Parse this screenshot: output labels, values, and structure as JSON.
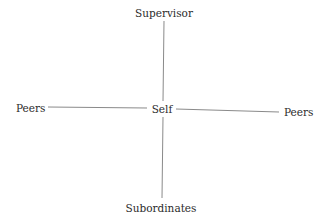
{
  "diagram": {
    "type": "radial-relationship",
    "center": {
      "label": "Self"
    },
    "nodes": {
      "top": {
        "label": "Supervisor"
      },
      "left": {
        "label": "Peers"
      },
      "right": {
        "label": "Peers"
      },
      "bottom": {
        "label": "Subordinates"
      }
    },
    "edges": [
      {
        "from": "Self",
        "to": "Supervisor"
      },
      {
        "from": "Self",
        "to": "Peers (left)"
      },
      {
        "from": "Self",
        "to": "Peers (right)"
      },
      {
        "from": "Self",
        "to": "Subordinates"
      }
    ],
    "colors": {
      "line": "#8a8a8a",
      "text": "#2b2b2b",
      "background": "#ffffff"
    }
  }
}
